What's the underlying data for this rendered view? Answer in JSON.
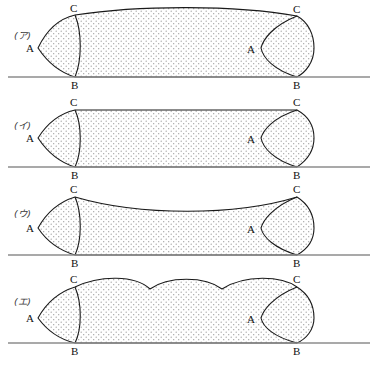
{
  "figure": {
    "background_color": "#ffffff",
    "outline_color": "#1a1a1a",
    "baseline_color": "#8c8c8c",
    "fill_pattern": "stipple-dots",
    "fill_dot_color": "#9a9a9a",
    "point_labels": {
      "a": "A",
      "b": "B",
      "c": "C"
    },
    "panels": [
      {
        "id": "panel-a",
        "tag": "(ア)",
        "top_edge": "convex",
        "top_edge_description": "Top edge bulges upward in a single smooth convex arc between the two C points.",
        "labels": {
          "left_a": "A",
          "left_b": "B",
          "left_c": "C",
          "right_a": "A",
          "right_b": "B",
          "right_c": "C"
        }
      },
      {
        "id": "panel-i",
        "tag": "(イ)",
        "top_edge": "straight",
        "top_edge_description": "Top edge is a flat straight horizontal line between the two C points.",
        "labels": {
          "left_a": "A",
          "left_b": "B",
          "left_c": "C",
          "right_a": "A",
          "right_b": "B",
          "right_c": "C"
        }
      },
      {
        "id": "panel-u",
        "tag": "(ウ)",
        "top_edge": "concave",
        "top_edge_description": "Top edge sags downward in a single smooth concave arc between the two C points.",
        "labels": {
          "left_a": "A",
          "left_b": "B",
          "left_c": "C",
          "right_a": "A",
          "right_b": "B",
          "right_c": "C"
        }
      },
      {
        "id": "panel-e",
        "tag": "(エ)",
        "top_edge": "scalloped",
        "top_edge_description": "Top edge is scalloped into three convex arcs separated by two downward cusps.",
        "labels": {
          "left_a": "A",
          "left_b": "B",
          "left_c": "C",
          "right_a": "A",
          "right_b": "B",
          "right_c": "C"
        }
      }
    ]
  }
}
